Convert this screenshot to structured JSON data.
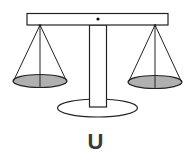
{
  "diagram": {
    "label": "U",
    "colors": {
      "stroke": "#222222",
      "pan_fill": "#b0b0b0",
      "label": "#3a3a3a"
    },
    "parts": [
      "beam",
      "pivot-dot",
      "post",
      "base",
      "left-pan",
      "right-pan"
    ]
  }
}
